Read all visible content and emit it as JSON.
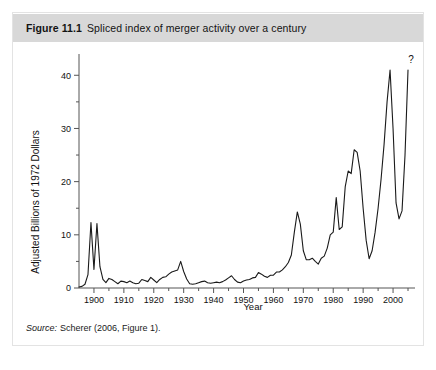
{
  "figure": {
    "label": "Figure 11.1",
    "caption": "Spliced index of merger activity over a century",
    "source_label": "Source:",
    "source_text": "Scherer (2006, Figure 1)."
  },
  "colors": {
    "header_band": "#d8d8d8",
    "card_border": "#e3e3e3",
    "line": "#1a1a1a",
    "axis": "#555555",
    "background": "#ffffff"
  },
  "chart_data": {
    "type": "line",
    "title": "Spliced index of merger activity over a century",
    "xlabel": "Year",
    "ylabel": "Adjusted Billions of 1972 Dollars",
    "xlim": [
      1895,
      2006
    ],
    "ylim": [
      0,
      44
    ],
    "xticks": [
      1900,
      1910,
      1920,
      1930,
      1940,
      1950,
      1960,
      1970,
      1980,
      1990,
      2000
    ],
    "xtick_labels": [
      "1900",
      "1910",
      "1920",
      "1930",
      "1940",
      "1950",
      "1960",
      "1970",
      "1980",
      "1990",
      "2000"
    ],
    "yticks": [
      0,
      10,
      20,
      30,
      40
    ],
    "ytick_labels": [
      "0",
      "10",
      "20",
      "30",
      "40"
    ],
    "minor_xticks": [
      1905,
      1915,
      1925,
      1935,
      1945,
      1955,
      1965,
      1975,
      1985,
      1995,
      2005
    ],
    "minor_yticks": [
      5,
      15,
      25,
      35
    ],
    "grid": false,
    "legend": "none",
    "annotations": [
      {
        "text": "?",
        "x": 2005,
        "y": 41.5,
        "name": "uncertainty-question-mark"
      }
    ],
    "series": [
      {
        "name": "Spliced merger activity index",
        "x": [
          1895,
          1896,
          1897,
          1898,
          1899,
          1900,
          1901,
          1902,
          1903,
          1904,
          1905,
          1906,
          1907,
          1908,
          1909,
          1910,
          1911,
          1912,
          1913,
          1914,
          1915,
          1916,
          1917,
          1918,
          1919,
          1920,
          1921,
          1922,
          1923,
          1924,
          1925,
          1926,
          1927,
          1928,
          1929,
          1930,
          1931,
          1932,
          1933,
          1934,
          1935,
          1936,
          1937,
          1938,
          1939,
          1940,
          1941,
          1942,
          1943,
          1944,
          1945,
          1946,
          1947,
          1948,
          1949,
          1950,
          1951,
          1952,
          1953,
          1954,
          1955,
          1956,
          1957,
          1958,
          1959,
          1960,
          1961,
          1962,
          1963,
          1964,
          1965,
          1966,
          1967,
          1968,
          1969,
          1970,
          1971,
          1972,
          1973,
          1974,
          1975,
          1976,
          1977,
          1978,
          1979,
          1980,
          1981,
          1982,
          1983,
          1984,
          1985,
          1986,
          1987,
          1988,
          1989,
          1990,
          1991,
          1992,
          1993,
          1994,
          1995,
          1996,
          1997,
          1998,
          1999,
          2000,
          2001,
          2002,
          2003,
          2004,
          2005
        ],
        "y": [
          0.2,
          0.3,
          0.7,
          2.5,
          12.3,
          3.5,
          12.1,
          4.0,
          1.6,
          1.0,
          1.8,
          1.6,
          1.2,
          0.8,
          1.3,
          1.2,
          1.0,
          1.3,
          1.0,
          0.8,
          0.9,
          1.6,
          1.4,
          1.2,
          2.0,
          1.5,
          1.0,
          1.6,
          2.0,
          2.1,
          2.6,
          3.0,
          3.2,
          3.4,
          5.0,
          3.1,
          1.7,
          0.8,
          0.7,
          0.8,
          1.0,
          1.2,
          1.3,
          1.0,
          0.9,
          1.0,
          1.1,
          1.0,
          1.2,
          1.5,
          1.9,
          2.3,
          1.6,
          1.1,
          1.0,
          1.3,
          1.5,
          1.6,
          1.9,
          2.0,
          2.9,
          2.6,
          2.2,
          2.0,
          2.4,
          2.4,
          3.0,
          3.0,
          3.4,
          4.0,
          4.8,
          6.2,
          10.5,
          14.3,
          12.0,
          7.0,
          5.3,
          5.3,
          5.6,
          5.0,
          4.5,
          5.6,
          6.0,
          7.5,
          10.0,
          10.5,
          17.0,
          11.0,
          11.5,
          19.0,
          22.0,
          21.5,
          26.0,
          25.5,
          22.0,
          15.0,
          9.0,
          5.5,
          7.0,
          10.5,
          15.0,
          20.5,
          27.0,
          35.0,
          41.0,
          30.0,
          16.0,
          13.0,
          14.5,
          25.0,
          41.0
        ]
      }
    ]
  },
  "axes": {
    "y_title": "Adjusted Billions of 1972 Dollars",
    "x_title": "Year"
  }
}
